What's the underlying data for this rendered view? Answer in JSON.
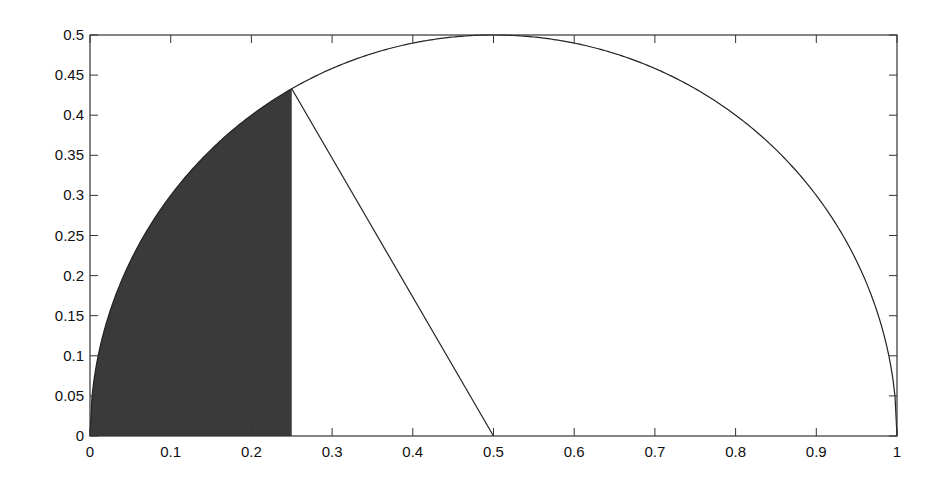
{
  "chart_data": {
    "type": "line",
    "title": "",
    "xlabel": "",
    "ylabel": "",
    "xlim": [
      0,
      1
    ],
    "ylim": [
      0,
      0.5
    ],
    "grid": false,
    "legend": null,
    "x_ticks": [
      "0",
      "0.1",
      "0.2",
      "0.3",
      "0.4",
      "0.5",
      "0.6",
      "0.7",
      "0.8",
      "0.9",
      "1"
    ],
    "y_ticks": [
      "0",
      "0.05",
      "0.1",
      "0.15",
      "0.2",
      "0.25",
      "0.3",
      "0.35",
      "0.4",
      "0.45",
      "0.5"
    ],
    "series": [
      {
        "name": "semicircle",
        "description": "Upper half of circle centered at (0.5, 0) with radius 0.5",
        "center": [
          0.5,
          0
        ],
        "radius": 0.5,
        "color": "#222222"
      },
      {
        "name": "radius-line",
        "description": "Line from point on circle to center",
        "points": [
          [
            0.25,
            0.433
          ],
          [
            0.5,
            0
          ]
        ],
        "color": "#222222"
      }
    ],
    "shaded_region": {
      "description": "Region under semicircle from x=0 to x=0.25",
      "x_range": [
        0,
        0.25
      ],
      "top_y_at_right": 0.433,
      "color": "#3a3a3a"
    }
  }
}
